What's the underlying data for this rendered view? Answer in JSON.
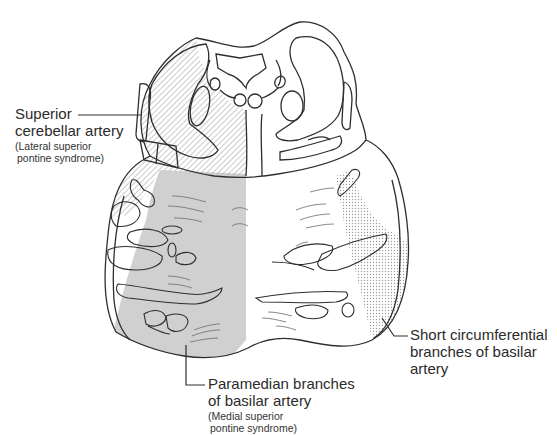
{
  "figure": {
    "colors": {
      "outline": "#2e2e2e",
      "paramedian_fill": "#d0d0d0",
      "hatch": "#8a8a8a",
      "stipple": "#9a9a9a",
      "background": "#ffffff"
    },
    "regions": [
      {
        "id": "superior-cerebellar",
        "pattern": "diagonal-hatch",
        "side": "left-dorsolateral"
      },
      {
        "id": "paramedian",
        "pattern": "solid-gray",
        "side": "left-ventromedial"
      },
      {
        "id": "short-circumferential",
        "pattern": "stipple",
        "side": "right-ventrolateral"
      }
    ]
  },
  "labels": {
    "superior_cerebellar": {
      "line1": "Superior",
      "line2": "cerebellar artery",
      "sub1": "(Lateral superior",
      "sub2": "pontine syndrome)"
    },
    "paramedian": {
      "line1": "Paramedian branches",
      "line2": "of basilar artery",
      "sub1": "(Medial superior",
      "sub2": "pontine syndrome)"
    },
    "short_circumferential": {
      "line1": "Short circumferential",
      "line2": "branches of basilar",
      "line3": "artery"
    }
  }
}
